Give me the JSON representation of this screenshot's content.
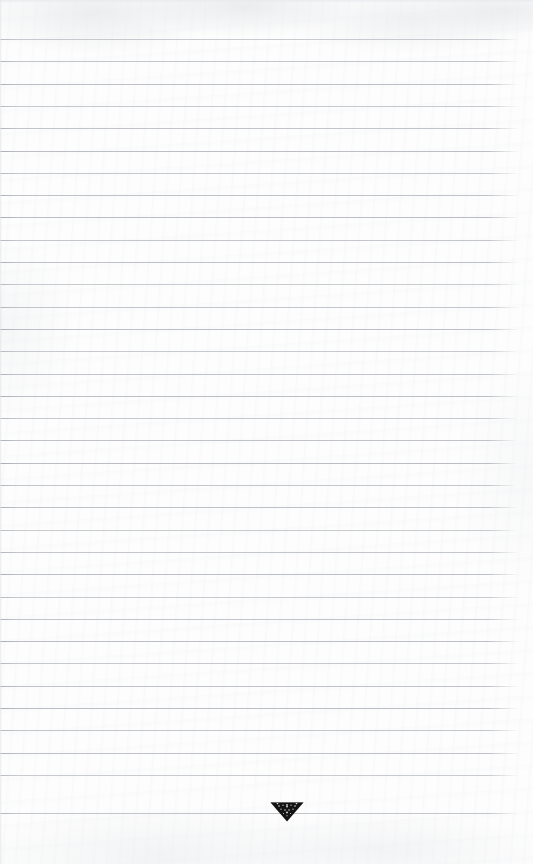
{
  "document": {
    "kind": "scanned-ruled-notebook-page",
    "page_width": 533,
    "page_height": 864,
    "paper_color": "#fdfdfd",
    "text_content": "",
    "handwriting_present": false,
    "is_blank": true
  },
  "ruling": {
    "line_color": "#b9bdc2",
    "line_thickness_px": 1,
    "line_spacing_px": 22.3,
    "first_line_y": 39,
    "line_count": 35,
    "left_start_x": 0,
    "right_end_x": 522,
    "right_margin_px": 11,
    "y_positions": [
      39,
      61.3,
      83.6,
      105.9,
      128.2,
      150.5,
      172.8,
      195.1,
      217.4,
      239.7,
      262,
      284.3,
      306.6,
      328.9,
      351.2,
      373.5,
      395.8,
      418.1,
      440.4,
      462.7,
      485,
      507.3,
      529.6,
      551.9,
      574.2,
      596.5,
      618.8,
      641.1,
      663.4,
      685.7,
      708,
      730.3,
      752.6,
      774.9,
      812.5
    ]
  },
  "emblem": {
    "label": "downward-pointing triangular crest emblem",
    "color": "#141414",
    "center_x": 287,
    "center_y": 812,
    "width": 34,
    "height": 20
  },
  "margins": {
    "top_blank_px": 39,
    "bottom_blank_px": 52
  }
}
